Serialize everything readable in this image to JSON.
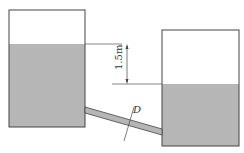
{
  "diagram": {
    "type": "two-tank-connected-by-pipe",
    "labels": {
      "head_difference": "1.5m",
      "pipe_diameter": "D"
    },
    "colors": {
      "water": "#b4b4b4",
      "outline": "#444444"
    }
  }
}
